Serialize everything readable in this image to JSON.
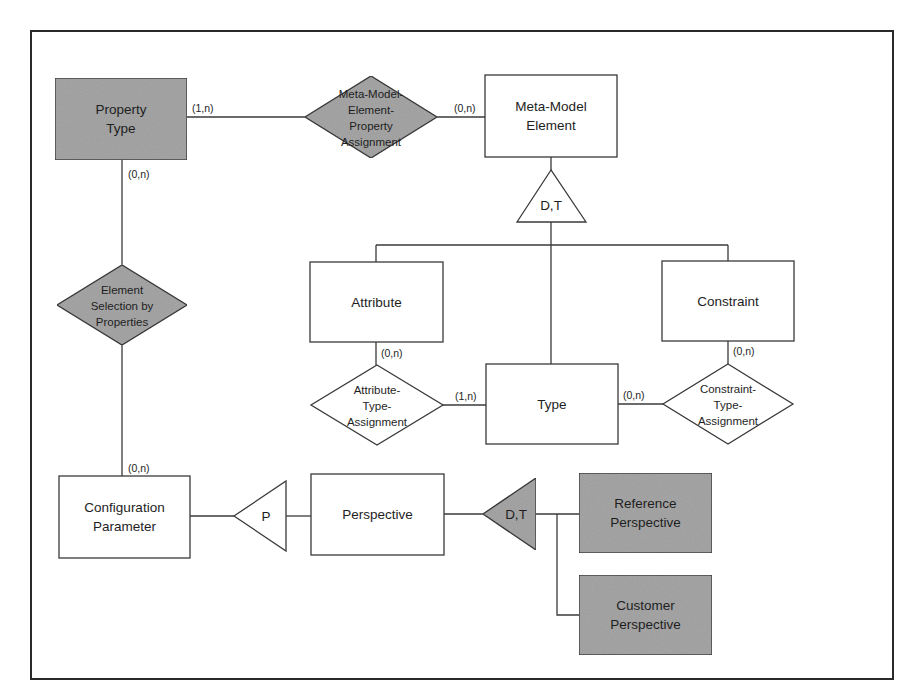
{
  "colors": {
    "shaded": "#a9a9a9",
    "plain": "#ffffff",
    "line": "#3a3a3a"
  },
  "entities": [
    {
      "id": "property-type",
      "lines": [
        "Property",
        "Type"
      ],
      "shaded": true,
      "x": 55,
      "y": 78,
      "w": 132,
      "h": 82
    },
    {
      "id": "meta-model-element",
      "lines": [
        "Meta-Model",
        "Element"
      ],
      "shaded": false,
      "x": 485,
      "y": 75,
      "w": 132,
      "h": 82
    },
    {
      "id": "attribute",
      "lines": [
        "Attribute"
      ],
      "shaded": false,
      "x": 310,
      "y": 262,
      "w": 133,
      "h": 80
    },
    {
      "id": "constraint",
      "lines": [
        "Constraint"
      ],
      "shaded": false,
      "x": 662,
      "y": 261,
      "w": 132,
      "h": 80
    },
    {
      "id": "type",
      "lines": [
        "Type"
      ],
      "shaded": false,
      "x": 486,
      "y": 364,
      "w": 132,
      "h": 80
    },
    {
      "id": "configuration-parameter",
      "lines": [
        "Configuration",
        "Parameter"
      ],
      "shaded": false,
      "x": 59,
      "y": 476,
      "w": 131,
      "h": 82
    },
    {
      "id": "perspective",
      "lines": [
        "Perspective"
      ],
      "shaded": false,
      "x": 311,
      "y": 474,
      "w": 133,
      "h": 81
    },
    {
      "id": "reference-perspective",
      "lines": [
        "Reference",
        "Perspective"
      ],
      "shaded": true,
      "x": 579,
      "y": 473,
      "w": 133,
      "h": 80
    },
    {
      "id": "customer-perspective",
      "lines": [
        "Customer",
        "Perspective"
      ],
      "shaded": true,
      "x": 579,
      "y": 575,
      "w": 133,
      "h": 80
    }
  ],
  "relationships": [
    {
      "id": "meta-model-element-property-assignment",
      "lines": [
        "Meta-Model-",
        "Element-",
        "Property",
        "Assignment"
      ],
      "shaded": true,
      "cx": 371,
      "cy": 117,
      "hw": 66,
      "hh": 41
    },
    {
      "id": "element-selection-by-properties",
      "lines": [
        "Element",
        "Selection by",
        "Properties"
      ],
      "shaded": true,
      "cx": 122,
      "cy": 305,
      "hw": 65,
      "hh": 40
    },
    {
      "id": "attribute-type-assignment",
      "lines": [
        "Attribute-",
        "Type-",
        "Assignment"
      ],
      "shaded": false,
      "cx": 377,
      "cy": 405,
      "hw": 66,
      "hh": 40
    },
    {
      "id": "constraint-type-assignment",
      "lines": [
        "Constraint-",
        "Type-",
        "Assignment"
      ],
      "shaded": false,
      "cx": 728,
      "cy": 404,
      "hw": 65,
      "hh": 40
    }
  ],
  "generalizations": [
    {
      "id": "gen-meta-model-element",
      "label": "D,T",
      "shaded": false,
      "points": "551,170 517,222 586,222",
      "lx": 551,
      "ly": 210
    },
    {
      "id": "gen-configuration-parameter",
      "label": "P",
      "shaded": false,
      "points": "234,516 286,481 286,551",
      "lx": 266,
      "ly": 521
    },
    {
      "id": "gen-perspective",
      "label": "D,T",
      "shaded": true,
      "points": "483,514 536,478 536,550",
      "lx": 516,
      "ly": 519
    }
  ],
  "connectors": [
    {
      "d": "M187,117 L305,117"
    },
    {
      "d": "M437,117 L485,117"
    },
    {
      "d": "M551,157 L551,170"
    },
    {
      "d": "M551,222 L551,364"
    },
    {
      "d": "M376,245 L728,245"
    },
    {
      "d": "M376,245 L376,262"
    },
    {
      "d": "M728,245 L728,261"
    },
    {
      "d": "M376,342 L376,365"
    },
    {
      "d": "M443,405 L486,405"
    },
    {
      "d": "M618,404 L663,404"
    },
    {
      "d": "M728,341 L728,364"
    },
    {
      "d": "M122,160 L122,265"
    },
    {
      "d": "M122,345 L122,476"
    },
    {
      "d": "M190,516 L234,516"
    },
    {
      "d": "M286,516 L311,516"
    },
    {
      "d": "M444,514 L483,514"
    },
    {
      "d": "M536,514 L579,514"
    },
    {
      "d": "M557,514 L557,615 L579,615"
    }
  ],
  "cardinalities": [
    {
      "text": "(1,n)",
      "x": 192,
      "y": 112
    },
    {
      "text": "(0,n)",
      "x": 454,
      "y": 112
    },
    {
      "text": "(0,n)",
      "x": 128,
      "y": 178
    },
    {
      "text": "(0,n)",
      "x": 381,
      "y": 357
    },
    {
      "text": "(1,n)",
      "x": 455,
      "y": 400
    },
    {
      "text": "(0,n)",
      "x": 623,
      "y": 399
    },
    {
      "text": "(0,n)",
      "x": 733,
      "y": 355
    },
    {
      "text": "(0,n)",
      "x": 128,
      "y": 472
    }
  ]
}
